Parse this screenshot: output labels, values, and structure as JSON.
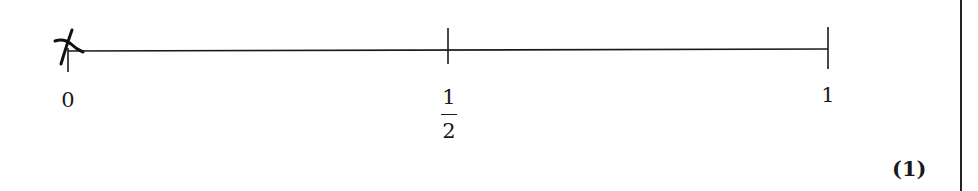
{
  "number_line": {
    "start_value": "0",
    "end_value": "1",
    "ticks": [
      {
        "value": 0,
        "label": "0",
        "x": 68
      },
      {
        "value": 0.5,
        "label_numerator": "1",
        "label_denominator": "2",
        "x": 448
      },
      {
        "value": 1,
        "label": "1",
        "x": 828
      }
    ],
    "line_y": 50,
    "line_color": "#1a1a1a"
  },
  "answer_mark": {
    "description": "handwritten cross mark at 0",
    "position_value": 0
  },
  "labels": {
    "zero": "0",
    "half_numerator": "1",
    "half_denominator": "2",
    "one": "1"
  },
  "marks_allocation": "(1)"
}
